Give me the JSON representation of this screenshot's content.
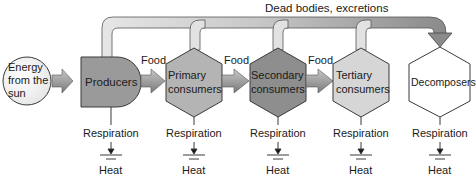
{
  "diagram": {
    "top_label": "Dead bodies, excretions",
    "source": {
      "lines": [
        "Energy",
        "from the",
        "sun"
      ]
    },
    "nodes": [
      {
        "id": "producers",
        "lines": [
          "Producers"
        ],
        "fill": "#9a9a9a"
      },
      {
        "id": "primary",
        "lines": [
          "Primary",
          "consumers"
        ],
        "fill": "#b4b4b4"
      },
      {
        "id": "secondary",
        "lines": [
          "Secondary",
          "consumers"
        ],
        "fill": "#8e8e8e"
      },
      {
        "id": "tertiary",
        "lines": [
          "Tertiary",
          "consumers"
        ],
        "fill": "#d6d6d6"
      },
      {
        "id": "decomposers",
        "lines": [
          "Decomposers"
        ],
        "fill": "#ffffff"
      }
    ],
    "edge_labels": {
      "food_1": "Food",
      "food_2": "Food",
      "food_3": "Food"
    },
    "respiration_label": "Respiration",
    "heat_label": "Heat",
    "colors": {
      "outline": "#3a3a3a",
      "pipe_light": "#e4e4e4",
      "pipe_dark": "#8a8a8a",
      "arrow": "#9c9c9c"
    }
  }
}
